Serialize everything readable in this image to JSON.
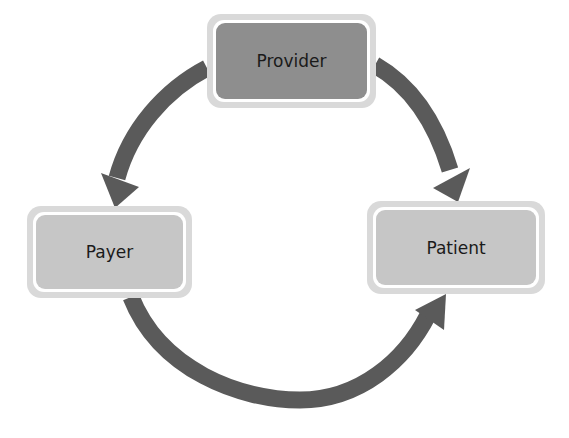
{
  "diagram": {
    "type": "cycle",
    "nodes": [
      {
        "id": "provider",
        "label": "Provider",
        "fill": "#8e8e8e"
      },
      {
        "id": "payer",
        "label": "Payer",
        "fill": "#c6c6c6"
      },
      {
        "id": "patient",
        "label": "Patient",
        "fill": "#c6c6c6"
      }
    ],
    "edges": [
      {
        "from": "provider",
        "to": "payer"
      },
      {
        "from": "provider",
        "to": "patient"
      },
      {
        "from": "payer",
        "to": "patient"
      }
    ],
    "colors": {
      "arrow": "#5a5a5a",
      "node_border": "#d9d9d9",
      "background": "#ffffff"
    }
  }
}
